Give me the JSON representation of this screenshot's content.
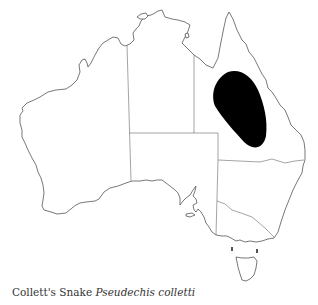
{
  "caption": {
    "common_name": "Collett's Snake",
    "scientific_name": "Pseudechis colletti"
  },
  "map": {
    "region": "Australia",
    "outline_color": "#555555",
    "range_color": "#000000",
    "range_description": "Central-western Queensland inland range"
  }
}
